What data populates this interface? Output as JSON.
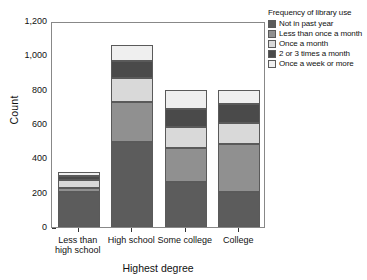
{
  "chart_data": {
    "type": "bar",
    "stacked": true,
    "title": "",
    "xlabel": "Highest degree",
    "ylabel": "Count",
    "categories": [
      "Less than high school",
      "High school",
      "Some college",
      "College"
    ],
    "category_labels_multiline": [
      [
        "Less than",
        "high school"
      ],
      [
        "High school",
        ""
      ],
      [
        "Some college",
        ""
      ],
      [
        "College",
        ""
      ]
    ],
    "ylim": [
      0,
      1200
    ],
    "yticks": [
      0,
      200,
      400,
      600,
      800,
      1000,
      1200
    ],
    "ytick_labels": [
      "0",
      "200",
      "400",
      "600",
      "800",
      "1,000",
      "1,200"
    ],
    "grid": false,
    "legend_position": "right",
    "legend_title": "Frequency of library use",
    "series": [
      {
        "name": "Not in past year",
        "color": "#5c5c5c",
        "values": [
          205,
          495,
          265,
          205
        ]
      },
      {
        "name": "Less than once a month",
        "color": "#909090",
        "values": [
          25,
          235,
          195,
          280
        ]
      },
      {
        "name": "Once a month",
        "color": "#d9d9d9",
        "values": [
          45,
          140,
          120,
          120
        ]
      },
      {
        "name": "2 or 3 times a month",
        "color": "#4a4a4a",
        "values": [
          20,
          95,
          110,
          110
        ]
      },
      {
        "name": "Once a week or more",
        "color": "#efefef",
        "values": [
          25,
          95,
          110,
          85
        ]
      }
    ],
    "totals": [
      320,
      1060,
      800,
      800
    ]
  },
  "legend": {
    "title": "Frequency of library use",
    "items": [
      {
        "label": "Not in past year"
      },
      {
        "label": "Less than once a month"
      },
      {
        "label": "Once a month"
      },
      {
        "label": "2 or 3 times a month"
      },
      {
        "label": "Once a week or more"
      }
    ]
  }
}
